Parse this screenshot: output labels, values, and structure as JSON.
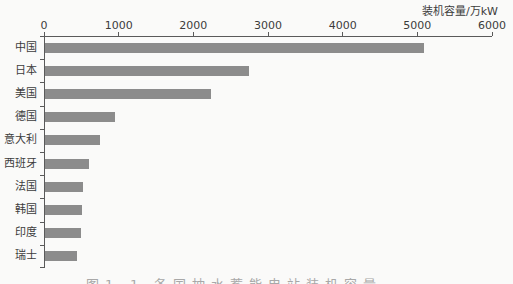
{
  "page": {
    "background": "#fafaf9"
  },
  "chart_data": {
    "type": "bar",
    "orientation": "horizontal",
    "title": "",
    "axis_label": "装机容量/万kW",
    "categories": [
      "中国",
      "日本",
      "美国",
      "德国",
      "意大利",
      "西班牙",
      "法国",
      "韩国",
      "印度",
      "瑞士"
    ],
    "values": [
      5070,
      2730,
      2220,
      940,
      730,
      585,
      510,
      495,
      485,
      430
    ],
    "xlim": [
      0,
      6000
    ],
    "x_ticks": [
      0,
      1000,
      2000,
      3000,
      4000,
      5000,
      6000
    ],
    "bar_color": "#8c8c8c",
    "axis_color": "#5a5a5a",
    "grid": false,
    "legend": false
  },
  "caption": {
    "text": "图1-1 各国抽水蓄能电站装机容量"
  }
}
